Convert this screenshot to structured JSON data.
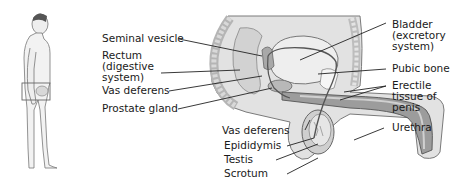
{
  "figure": {
    "type": "anatomical diagram",
    "inset": "standing male figure with highlighted pelvic region",
    "colors": {
      "tissue_light": "#e8e8e8",
      "tissue_mid": "#c9c9c9",
      "tissue_dark": "#9a9a9a",
      "outline": "#5a5a5a",
      "leader": "#222222"
    }
  },
  "labels": {
    "left": [
      {
        "id": "seminal-vesicle",
        "lines": [
          "Seminal vesicle"
        ]
      },
      {
        "id": "rectum",
        "lines": [
          "Rectum",
          "(digestive",
          "system)"
        ]
      },
      {
        "id": "vas-deferens-upper",
        "lines": [
          "Vas deferens"
        ]
      },
      {
        "id": "prostate-gland",
        "lines": [
          "Prostate gland"
        ]
      }
    ],
    "bottom": [
      {
        "id": "vas-deferens-lower",
        "lines": [
          "Vas deferens"
        ]
      },
      {
        "id": "epididymis",
        "lines": [
          "Epididymis"
        ]
      },
      {
        "id": "testis",
        "lines": [
          "Testis"
        ]
      },
      {
        "id": "scrotum",
        "lines": [
          "Scrotum"
        ]
      }
    ],
    "right": [
      {
        "id": "bladder",
        "lines": [
          "Bladder",
          "(excretory",
          "system)"
        ]
      },
      {
        "id": "pubic-bone",
        "lines": [
          "Pubic bone"
        ]
      },
      {
        "id": "erectile-tissue",
        "lines": [
          "Erectile",
          "tissue of",
          "penis"
        ]
      },
      {
        "id": "urethra",
        "lines": [
          "Urethra"
        ]
      }
    ]
  }
}
